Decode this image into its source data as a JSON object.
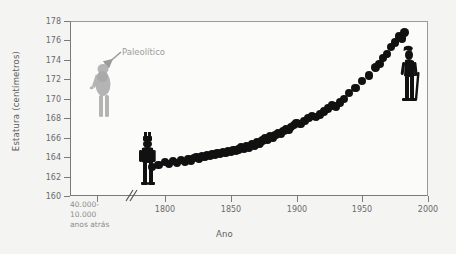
{
  "chart_data": {
    "type": "scatter",
    "title": "",
    "xlabel": "Ano",
    "ylabel": "Estatura (centímetros)",
    "ylim": [
      160,
      178
    ],
    "yticks": [
      160,
      162,
      164,
      166,
      168,
      170,
      172,
      174,
      176,
      178
    ],
    "xticks": [
      "40.000-10.000 anos atrás",
      "1800",
      "1850",
      "1900",
      "1950",
      "2000"
    ],
    "xtick_years": [
      1800,
      1850,
      1900,
      1950,
      2000
    ],
    "xlim": [
      1780,
      2000
    ],
    "axis_break": true,
    "grid": false,
    "legend": null,
    "annotations": [
      {
        "text": "Paleolítico",
        "x_category": "40.000-10.000 anos atrás",
        "y": 172.3,
        "color": "#9b9b9b"
      }
    ],
    "series": [
      {
        "name": "Paleolítico",
        "color": "#a9a9a9",
        "points": [
          {
            "x_category": "40.000-10.000 anos atrás",
            "y": 172.3
          }
        ]
      },
      {
        "name": "Estatura média (Europa)",
        "color": "#111111",
        "x": [
          1790,
          1795,
          1800,
          1803,
          1806,
          1809,
          1812,
          1815,
          1818,
          1820,
          1822,
          1824,
          1826,
          1828,
          1830,
          1832,
          1834,
          1836,
          1838,
          1840,
          1842,
          1844,
          1846,
          1848,
          1850,
          1852,
          1854,
          1856,
          1858,
          1860,
          1862,
          1864,
          1866,
          1868,
          1870,
          1872,
          1874,
          1876,
          1878,
          1880,
          1882,
          1884,
          1886,
          1888,
          1890,
          1892,
          1894,
          1896,
          1898,
          1900,
          1903,
          1906,
          1909,
          1912,
          1915,
          1918,
          1921,
          1924,
          1927,
          1930,
          1933,
          1936,
          1940,
          1945,
          1950,
          1955,
          1960,
          1963,
          1966,
          1969,
          1972,
          1975,
          1978,
          1980,
          1982
        ],
        "y": [
          163.0,
          163.2,
          163.5,
          163.3,
          163.6,
          163.4,
          163.7,
          163.5,
          163.8,
          163.6,
          163.9,
          164.0,
          163.8,
          164.1,
          164.0,
          164.2,
          164.1,
          164.3,
          164.2,
          164.4,
          164.3,
          164.5,
          164.4,
          164.6,
          164.5,
          164.7,
          164.6,
          164.8,
          165.0,
          164.9,
          165.1,
          165.0,
          165.3,
          165.2,
          165.5,
          165.4,
          165.7,
          165.9,
          165.8,
          166.1,
          166.0,
          166.3,
          166.5,
          166.4,
          166.7,
          166.9,
          166.8,
          167.1,
          167.3,
          167.5,
          167.4,
          167.7,
          168.0,
          168.2,
          168.1,
          168.4,
          168.7,
          169.0,
          169.3,
          169.2,
          169.6,
          170.0,
          170.6,
          171.1,
          171.8,
          172.4,
          173.2,
          173.6,
          174.2,
          174.6,
          175.3,
          175.8,
          176.4,
          176.2,
          176.8
        ]
      }
    ]
  },
  "figures": {
    "paleolithic_figure": {
      "name": "paleolithic-person-silhouette",
      "color": "#b0b0b0"
    },
    "soldier_figure": {
      "name": "1800s-soldier-silhouette",
      "color": "#111111"
    },
    "modern_figure": {
      "name": "modern-person-silhouette",
      "color": "#111111"
    }
  }
}
